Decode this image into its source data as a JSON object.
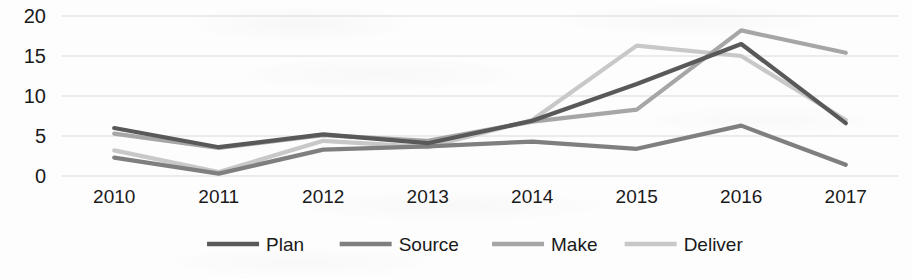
{
  "chart_data": {
    "type": "line",
    "title": "",
    "subtitle": "",
    "xlabel": "",
    "ylabel": "",
    "categories": [
      "2010",
      "2011",
      "2012",
      "2013",
      "2014",
      "2015",
      "2016",
      "2017"
    ],
    "x": [
      2010,
      2011,
      2012,
      2013,
      2014,
      2015,
      2016,
      2017
    ],
    "ylim": [
      0,
      20
    ],
    "y_ticks": [
      0,
      5,
      10,
      15,
      20
    ],
    "y_tick_labels": [
      "0",
      "5",
      "10",
      "15",
      "20"
    ],
    "grid": "horizontal",
    "legend_position": "bottom",
    "series": [
      {
        "name": "Plan",
        "color": "#595959",
        "values": [
          6.0,
          3.6,
          5.2,
          4.1,
          6.9,
          11.5,
          16.5,
          6.6
        ]
      },
      {
        "name": "Source",
        "color": "#7f7f7f",
        "values": [
          2.3,
          0.3,
          3.3,
          3.7,
          4.3,
          3.4,
          6.3,
          1.4
        ]
      },
      {
        "name": "Make",
        "color": "#a6a6a6",
        "values": [
          5.3,
          3.5,
          5.1,
          4.4,
          6.8,
          8.3,
          18.2,
          15.4
        ]
      },
      {
        "name": "Deliver",
        "color": "#c8c8c8",
        "values": [
          3.2,
          0.5,
          4.4,
          3.6,
          7.0,
          16.3,
          15.0,
          7.0
        ]
      }
    ]
  },
  "legend": {
    "items": [
      {
        "label": "Plan",
        "color": "#595959"
      },
      {
        "label": "Source",
        "color": "#7f7f7f"
      },
      {
        "label": "Make",
        "color": "#a6a6a6"
      },
      {
        "label": "Deliver",
        "color": "#c8c8c8"
      }
    ]
  },
  "axes": {
    "y_tick_labels": [
      "20",
      "15",
      "10",
      "5",
      "0"
    ],
    "x_tick_labels": [
      "2010",
      "2011",
      "2012",
      "2013",
      "2014",
      "2015",
      "2016",
      "2017"
    ]
  }
}
